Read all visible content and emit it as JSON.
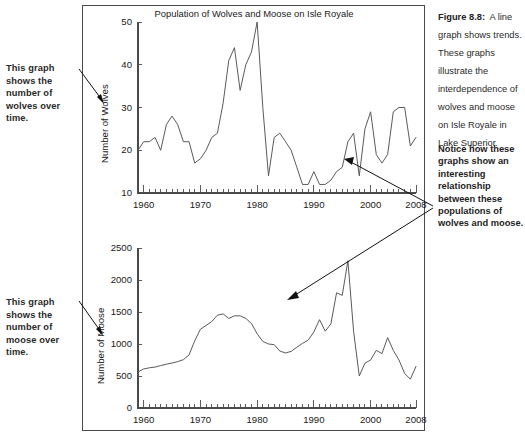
{
  "caption": {
    "figure_label": "Figure 8.8:",
    "body": "A line graph shows trends. These graphs illustrate the interdependence of wolves and moose on Isle Royale in Lake Superior.",
    "notice": "Notice how these graphs show an interesting relationship between these populations of wolves and moose."
  },
  "annotations": {
    "wolves_note": "This graph shows the number of wolves over time.",
    "moose_note": "This graph shows the number of moose over time."
  },
  "colors": {
    "line": "#5a5a5a",
    "axis": "#4a4a4a",
    "text": "#1a1a1a",
    "note_text": "#2a2a2a",
    "frame": "#4a4a4a"
  },
  "chart_data": [
    {
      "type": "line",
      "name": "wolves",
      "title": "Population of Wolves and Moose on Isle Royale",
      "xlabel": "",
      "ylabel": "Number of Wolves",
      "xlim": [
        1959,
        2008
      ],
      "ylim": [
        10,
        50
      ],
      "yticks": [
        10,
        20,
        30,
        40,
        50
      ],
      "xticks": [
        1960,
        1970,
        1980,
        1990,
        2000,
        2008
      ],
      "minor_xticks": true,
      "grid": false,
      "legend": "none",
      "x": [
        1959,
        1960,
        1961,
        1962,
        1963,
        1964,
        1965,
        1966,
        1967,
        1968,
        1969,
        1970,
        1971,
        1972,
        1973,
        1974,
        1975,
        1976,
        1977,
        1978,
        1979,
        1980,
        1981,
        1982,
        1983,
        1984,
        1985,
        1986,
        1987,
        1988,
        1989,
        1990,
        1991,
        1992,
        1993,
        1994,
        1995,
        1996,
        1997,
        1998,
        1999,
        2000,
        2001,
        2002,
        2003,
        2004,
        2005,
        2006,
        2007,
        2008
      ],
      "y": [
        20,
        22,
        22,
        23,
        20,
        26,
        28,
        26,
        22,
        22,
        17,
        18,
        20,
        23,
        24,
        31,
        41,
        44,
        34,
        40,
        43,
        50,
        30,
        14,
        23,
        24,
        22,
        20,
        16,
        12,
        12,
        15,
        12,
        12,
        13,
        15,
        16,
        22,
        24,
        14,
        25,
        29,
        19,
        17,
        19,
        29,
        30,
        30,
        21,
        23
      ]
    },
    {
      "type": "line",
      "name": "moose",
      "title": "",
      "xlabel": "",
      "ylabel": "Number of Moose",
      "xlim": [
        1959,
        2008
      ],
      "ylim": [
        0,
        2500
      ],
      "yticks": [
        0,
        500,
        1000,
        1500,
        2000,
        2500
      ],
      "xticks": [
        1960,
        1970,
        1980,
        1990,
        2000,
        2008
      ],
      "minor_xticks": true,
      "grid": false,
      "legend": "none",
      "x": [
        1959,
        1960,
        1961,
        1962,
        1963,
        1964,
        1965,
        1966,
        1967,
        1968,
        1969,
        1970,
        1971,
        1972,
        1973,
        1974,
        1975,
        1976,
        1977,
        1978,
        1979,
        1980,
        1981,
        1982,
        1983,
        1984,
        1985,
        1986,
        1987,
        1988,
        1989,
        1990,
        1991,
        1992,
        1993,
        1994,
        1995,
        1996,
        1997,
        1998,
        1999,
        2000,
        2001,
        2002,
        2003,
        2004,
        2005,
        2006,
        2007,
        2008
      ],
      "y": [
        563,
        610,
        628,
        639,
        663,
        684,
        703,
        725,
        755,
        830,
        1050,
        1230,
        1290,
        1350,
        1450,
        1470,
        1400,
        1440,
        1440,
        1400,
        1320,
        1160,
        1040,
        1000,
        990,
        890,
        860,
        885,
        950,
        1010,
        1060,
        1190,
        1380,
        1200,
        1315,
        1800,
        1760,
        2300,
        1200,
        500,
        700,
        750,
        900,
        850,
        1100,
        900,
        750,
        540,
        450,
        650
      ]
    }
  ]
}
